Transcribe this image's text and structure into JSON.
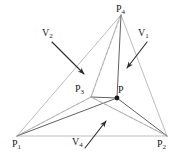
{
  "figure": {
    "type": "geometric-diagram",
    "background_color": "#ffffff",
    "line_color_light": "#b0b0b0",
    "line_color_dark": "#4a4a4a",
    "arrow_color": "#2b2b2b",
    "label_color": "#1a1a1a",
    "labels": {
      "p4": {
        "base": "P",
        "sub": "4"
      },
      "p3": {
        "base": "P",
        "sub": "3"
      },
      "p": {
        "base": "P",
        "sub": ""
      },
      "p1": {
        "base": "P",
        "sub": "1"
      },
      "p2": {
        "base": "P",
        "sub": "2"
      },
      "v1": {
        "base": "V",
        "sub": "1"
      },
      "v2": {
        "base": "V",
        "sub": "2"
      },
      "v4": {
        "base": "V",
        "sub": "4"
      }
    },
    "points": {
      "p4": [
        121,
        15
      ],
      "p3": [
        91,
        97
      ],
      "p": [
        117,
        98
      ],
      "p1": [
        17,
        136
      ],
      "p2": [
        167,
        136
      ]
    },
    "annotations": [
      {
        "name": "V2",
        "arrow_from": [
          52,
          42
        ],
        "arrow_to": [
          86,
          76
        ]
      },
      {
        "name": "V1",
        "arrow_from": [
          147,
          42
        ],
        "arrow_to": [
          125,
          70
        ]
      },
      {
        "name": "V4",
        "arrow_from": [
          85,
          148
        ],
        "arrow_to": [
          106,
          120
        ]
      }
    ]
  }
}
